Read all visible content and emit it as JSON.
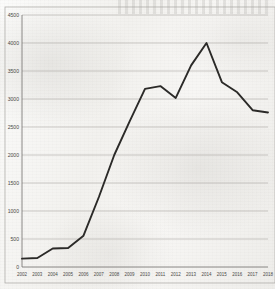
{
  "chart_data": {
    "type": "line",
    "title": "",
    "subtitle": "",
    "xlabel": "",
    "ylabel": "",
    "categories": [
      "2002",
      "2003",
      "2004",
      "2005",
      "2006",
      "2007",
      "2008",
      "2009",
      "2010",
      "2011",
      "2012",
      "2013",
      "2014",
      "2015",
      "2016",
      "2017",
      "2018"
    ],
    "x": [
      2002,
      2003,
      2004,
      2005,
      2006,
      2007,
      2008,
      2009,
      2010,
      2011,
      2012,
      2013,
      2014,
      2015,
      2016,
      2017,
      2018
    ],
    "values": [
      150,
      160,
      330,
      340,
      560,
      1250,
      2000,
      2600,
      3180,
      3230,
      3020,
      3600,
      4000,
      3300,
      3120,
      2800,
      2760
    ],
    "series": [
      {
        "name": "",
        "values": [
          150,
          160,
          330,
          340,
          560,
          1250,
          2000,
          2600,
          3180,
          3230,
          3020,
          3600,
          4000,
          3300,
          3120,
          2800,
          2760
        ]
      }
    ],
    "ylim": [
      0,
      4500
    ],
    "xlim": [
      2002,
      2018
    ],
    "y_ticks": [
      0,
      500,
      1000,
      1500,
      2000,
      2500,
      3000,
      3500,
      4000,
      4500
    ],
    "y_tick_labels": [
      "0",
      "500",
      "1000",
      "1500",
      "2000",
      "2500",
      "3000",
      "3500",
      "4000",
      "4500"
    ],
    "x_tick_labels": [
      "2002",
      "2003",
      "2004",
      "2005",
      "2006",
      "2007",
      "2008",
      "2009",
      "2010",
      "2011",
      "2012",
      "2013",
      "2014",
      "2015",
      "2016",
      "2017",
      "2018"
    ],
    "grid": true,
    "grid_axis": "y",
    "legend": false,
    "legend_position": "none",
    "annotations": [],
    "line_color": "#2b2a28",
    "grid_color": "#9c9b97",
    "axis_color": "#6e6d69",
    "background_color": "#f4f3f0"
  },
  "figure": {
    "plot_left": 22,
    "plot_right": 268,
    "plot_top": 15,
    "plot_bottom": 267
  }
}
